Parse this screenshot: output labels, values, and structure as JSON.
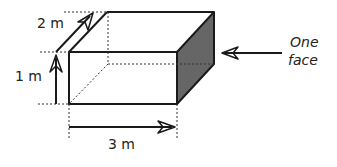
{
  "diagram": {
    "labels": {
      "depth": "2 m",
      "height": "1 m",
      "width": "3 m",
      "face_line1": "One",
      "face_line2": "face"
    },
    "colors": {
      "stroke": "#1a1a1a",
      "face_fill": "#666666",
      "background": "#ffffff"
    }
  }
}
